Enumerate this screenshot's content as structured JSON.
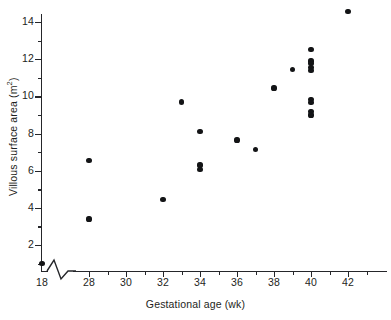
{
  "chart_data": {
    "type": "scatter",
    "title": "",
    "xlabel": "Gestational age (wk)",
    "ylabel": "Villous surface area (m2)",
    "ylabel_display": "Villous surface area (m",
    "ylabel_sup": "2",
    "ylabel_tail": ")",
    "xlim": [
      18,
      43.5
    ],
    "ylim": [
      0,
      15.1
    ],
    "grid": false,
    "legend": null,
    "axis_break": {
      "axis": "x",
      "style": "zigzag",
      "between": [
        18,
        28
      ]
    },
    "xticks_major": [
      18,
      28,
      30,
      32,
      34,
      36,
      38,
      40,
      42
    ],
    "xticks_major_labels": [
      "18",
      "28",
      "30",
      "32",
      "34",
      "36",
      "38",
      "40",
      "42"
    ],
    "xticks_minor": [
      29,
      31,
      33,
      35,
      37,
      39,
      41,
      43
    ],
    "yticks_major": [
      2,
      4,
      6,
      8,
      10,
      12,
      14
    ],
    "yticks_major_labels": [
      "2",
      "4",
      "6",
      "8",
      "10",
      "12",
      "14"
    ],
    "yticks_minor": [
      1,
      3,
      5,
      7,
      9,
      11,
      13,
      15
    ],
    "marker": "filled-circle",
    "marker_color": "#131416",
    "n_points": 22,
    "points": [
      {
        "x": 18,
        "y": 1.0
      },
      {
        "x": 28,
        "y": 6.55
      },
      {
        "x": 28,
        "y": 3.4
      },
      {
        "x": 32,
        "y": 4.45
      },
      {
        "x": 33,
        "y": 9.7
      },
      {
        "x": 34,
        "y": 8.1
      },
      {
        "x": 34,
        "y": 6.3
      },
      {
        "x": 34,
        "y": 6.05
      },
      {
        "x": 36,
        "y": 7.65
      },
      {
        "x": 37,
        "y": 7.15
      },
      {
        "x": 38,
        "y": 10.45
      },
      {
        "x": 39,
        "y": 11.45
      },
      {
        "x": 40,
        "y": 12.5
      },
      {
        "x": 40,
        "y": 11.9
      },
      {
        "x": 40,
        "y": 11.75
      },
      {
        "x": 40,
        "y": 11.55
      },
      {
        "x": 40,
        "y": 11.4
      },
      {
        "x": 40,
        "y": 9.85
      },
      {
        "x": 40,
        "y": 9.65
      },
      {
        "x": 40,
        "y": 9.2
      },
      {
        "x": 40,
        "y": 9.0
      },
      {
        "x": 42,
        "y": 14.55
      }
    ]
  },
  "colors": {
    "axis": "#25262a",
    "marker": "#131416",
    "background": "#ffffff",
    "text": "#1d1e21"
  }
}
